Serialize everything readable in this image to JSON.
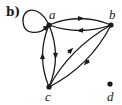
{
  "panel": {
    "label": "b)"
  },
  "graph": {
    "type": "directed",
    "nodes": [
      {
        "id": "a",
        "label": "a",
        "x": 49,
        "y": 25
      },
      {
        "id": "b",
        "label": "b",
        "x": 111,
        "y": 25
      },
      {
        "id": "c",
        "label": "c",
        "x": 49,
        "y": 87
      },
      {
        "id": "d",
        "label": "d",
        "x": 110,
        "y": 84
      }
    ],
    "edges": [
      {
        "from": "a",
        "to": "a",
        "kind": "loop"
      },
      {
        "from": "a",
        "to": "b",
        "kind": "upper-arc"
      },
      {
        "from": "b",
        "to": "a",
        "kind": "lower-arc"
      },
      {
        "from": "c",
        "to": "a",
        "kind": "left-arc"
      },
      {
        "from": "a",
        "to": "c",
        "kind": "right-arc"
      },
      {
        "from": "c",
        "to": "b",
        "kind": "upper-diagonal"
      },
      {
        "from": "b",
        "to": "c",
        "kind": "lower-diagonal"
      }
    ]
  },
  "colors": {
    "stroke": "#1a1a1a",
    "background": "#ffffff"
  }
}
